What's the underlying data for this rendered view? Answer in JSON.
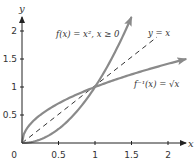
{
  "chart_data": {
    "type": "line",
    "title": "",
    "xlabel": "x",
    "ylabel": "y",
    "xlim": [
      0,
      2.25
    ],
    "ylim": [
      0,
      2.25
    ],
    "x_ticks": [
      "0",
      "0.5",
      "1",
      "1.5",
      "2"
    ],
    "y_ticks": [
      "0.5",
      "1",
      "1.5",
      "2"
    ],
    "grid": false,
    "legend": "inline annotations",
    "series": [
      {
        "name": "f(x) = x², x ≥ 0",
        "style": "solid-arrow",
        "color": "#8a8a8a",
        "x": [
          0,
          0.25,
          0.5,
          0.75,
          1,
          1.25,
          1.5
        ],
        "y": [
          0,
          0.0625,
          0.25,
          0.5625,
          1,
          1.5625,
          2.25
        ]
      },
      {
        "name": "f⁻¹(x) = √x",
        "style": "solid-arrow",
        "color": "#8a8a8a",
        "x": [
          0,
          0.0625,
          0.25,
          0.5625,
          1,
          1.5625,
          2.25
        ],
        "y": [
          0,
          0.25,
          0.5,
          0.75,
          1,
          1.25,
          1.5
        ]
      },
      {
        "name": "y = x",
        "style": "dashed",
        "color": "#333333",
        "x": [
          0,
          1.9
        ],
        "y": [
          0,
          1.9
        ]
      }
    ],
    "annotations": [
      {
        "text": "f(x) = x², x ≥ 0",
        "x": 0.65,
        "y": 1.95
      },
      {
        "text": "y = x",
        "x": 1.85,
        "y": 1.85
      },
      {
        "text": "f⁻¹(x) = √x",
        "x": 1.4,
        "y": 1.05
      }
    ]
  },
  "labels": {
    "x_axis": "x",
    "y_axis": "y",
    "origin": "0",
    "x_ticks": [
      "0.5",
      "1",
      "1.5",
      "2"
    ],
    "y_ticks": [
      "0.5",
      "1",
      "1.5",
      "2"
    ],
    "f_label": "f(x) = x², x ≥ 0",
    "identity_label": "y = x",
    "inverse_label": "f⁻¹(x) = √x"
  }
}
